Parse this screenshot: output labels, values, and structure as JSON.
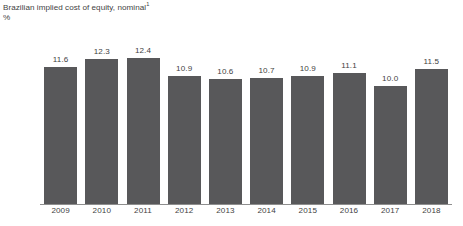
{
  "chart_data": {
    "type": "bar",
    "title": "Brazilian implied cost of equity, nominal",
    "title_footnote_marker": "1",
    "subtitle": "%",
    "xlabel": "",
    "ylabel": "%",
    "categories": [
      "2009",
      "2010",
      "2011",
      "2012",
      "2013",
      "2014",
      "2015",
      "2016",
      "2017",
      "2018"
    ],
    "values": [
      11.6,
      12.3,
      12.4,
      10.9,
      10.6,
      10.7,
      10.9,
      11.1,
      10.0,
      11.5
    ],
    "value_labels": [
      "11.6",
      "12.3",
      "12.4",
      "10.9",
      "10.6",
      "10.7",
      "10.9",
      "11.1",
      "10.0",
      "11.5"
    ],
    "ylim": [
      0,
      12.4
    ],
    "grid": false,
    "legend": "none",
    "bar_color": "#58585a",
    "axis_color": "#8e8e8e",
    "text_color": "#3f3f3f",
    "background_color": "#ffffff"
  }
}
